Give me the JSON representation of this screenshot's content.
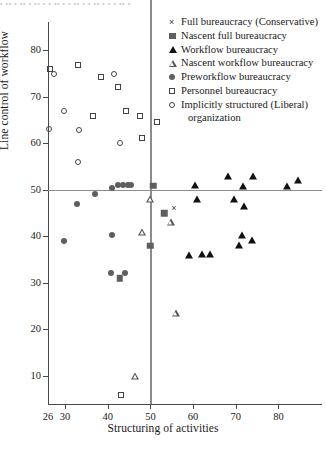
{
  "topstrip": "•  ••  • ••  • ••  •  •  ••  •   •  ••   • •  ••  •   • •  ••  •",
  "axes": {
    "y_title": "Line control of workflow",
    "x_title": "Structuring of activities",
    "y_ticks": [
      "10",
      "20",
      "30",
      "40",
      "50",
      "60",
      "70",
      "80"
    ],
    "x_ticks": [
      "26",
      "30",
      "40",
      "50",
      "60",
      "70",
      "80"
    ]
  },
  "legend": {
    "items": [
      {
        "marker": "x-cross",
        "label": "Full bureaucracy (Conservative)"
      },
      {
        "marker": "filled-square",
        "label": "Nascent full bureaucracy"
      },
      {
        "marker": "filled-triangle",
        "label": "Workflow bureaucracy"
      },
      {
        "marker": "open-triangle",
        "label": "Nascent workflow bureaucracy"
      },
      {
        "marker": "filled-circle",
        "label": "Preworkflow bureaucracy"
      },
      {
        "marker": "open-square",
        "label": "Personnel bureaucracy"
      },
      {
        "marker": "open-circle",
        "label": "Implicitly structured (Liberal)"
      }
    ],
    "continuation": "organization"
  },
  "chart_data": {
    "type": "scatter",
    "title": "",
    "xlabel": "Structuring of activities",
    "ylabel": "Line control of workflow",
    "xlim": [
      26,
      86
    ],
    "ylim": [
      4,
      86
    ],
    "grid": false,
    "legend_position": "top-right",
    "reference_lines": {
      "horizontal_y": 50,
      "vertical_x": 50
    },
    "series": [
      {
        "name": "Full bureaucracy (Conservative)",
        "marker": "x-cross",
        "points": [
          [
            55.5,
            46.0
          ]
        ]
      },
      {
        "name": "Nascent full bureaucracy",
        "marker": "filled-square",
        "points": [
          [
            50.7,
            50.8
          ],
          [
            53.2,
            45.0
          ],
          [
            50.0,
            38.0
          ],
          [
            42.8,
            31.0
          ]
        ]
      },
      {
        "name": "Workflow bureaucracy",
        "marker": "filled-triangle",
        "points": [
          [
            60.5,
            51.0
          ],
          [
            68.2,
            53.0
          ],
          [
            71.8,
            50.8
          ],
          [
            74.0,
            53.0
          ],
          [
            82.0,
            50.8
          ],
          [
            84.5,
            52.0
          ],
          [
            61.0,
            48.0
          ],
          [
            69.5,
            48.0
          ],
          [
            72.0,
            46.5
          ],
          [
            71.5,
            40.3
          ],
          [
            73.8,
            39.3
          ],
          [
            70.8,
            38.2
          ],
          [
            59.0,
            36.0
          ],
          [
            62.0,
            36.3
          ],
          [
            64.0,
            36.2
          ]
        ]
      },
      {
        "name": "Nascent workflow bureaucracy",
        "marker": "open-triangle",
        "points": [
          [
            50.0,
            48.0
          ],
          [
            54.8,
            44.6
          ],
          [
            48.2,
            44.0
          ],
          [
            56.0,
            28.0
          ],
          [
            46.5,
            16.0
          ]
        ]
      },
      {
        "name": "Preworkflow bureaucracy",
        "marker": "filled-circle",
        "points": [
          [
            43.5,
            51.0
          ],
          [
            44.8,
            51.0
          ],
          [
            45.5,
            51.0
          ],
          [
            42.5,
            51.0
          ],
          [
            41.0,
            50.3
          ],
          [
            37.0,
            49.0
          ],
          [
            32.8,
            47.0
          ],
          [
            29.8,
            39.0
          ],
          [
            41.0,
            40.2
          ],
          [
            40.8,
            32.2
          ],
          [
            44.0,
            32.2
          ]
        ]
      },
      {
        "name": "Personnel bureaucracy",
        "marker": "open-square",
        "points": [
          [
            26.5,
            76.0
          ],
          [
            33.0,
            76.8
          ],
          [
            38.5,
            74.2
          ],
          [
            42.5,
            72.0
          ],
          [
            36.5,
            65.8
          ],
          [
            44.2,
            66.8
          ],
          [
            47.5,
            65.8
          ],
          [
            51.5,
            64.6
          ],
          [
            48.0,
            61.0
          ],
          [
            43.0,
            6.0
          ]
        ]
      },
      {
        "name": "Implicitly structured (Liberal) organization",
        "marker": "open-circle",
        "points": [
          [
            27.5,
            74.8
          ],
          [
            41.5,
            74.8
          ],
          [
            29.8,
            66.8
          ],
          [
            26.2,
            63.0
          ],
          [
            33.2,
            62.8
          ],
          [
            42.8,
            60.0
          ],
          [
            33.0,
            56.0
          ]
        ]
      }
    ]
  }
}
